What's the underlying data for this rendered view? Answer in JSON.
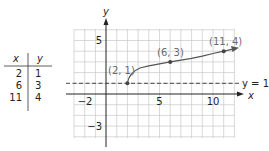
{
  "table": {
    "headers": [
      "x",
      "y"
    ],
    "rows": [
      {
        "x": "2",
        "y": "1"
      },
      {
        "x": "6",
        "y": "3"
      },
      {
        "x": "11",
        "y": "4"
      }
    ]
  },
  "graph": {
    "x_axis_label": "x",
    "y_axis_label": "y",
    "x_ticks": {
      "neg2": "−2",
      "five": "5",
      "ten": "10"
    },
    "y_ticks": {
      "five": "5",
      "neg3": "−3"
    },
    "asymptote_label": "y = 1",
    "points": [
      {
        "label": "(2, 1)",
        "x": 2,
        "y": 1
      },
      {
        "label": "(6, 3)",
        "x": 6,
        "y": 3
      },
      {
        "label": "(11, 4)",
        "x": 11,
        "y": 4
      }
    ],
    "colors": {
      "curve": "#555555",
      "grid": "#c8c8c8",
      "axis": "#222222",
      "point_label": "#6b6b6b"
    }
  }
}
